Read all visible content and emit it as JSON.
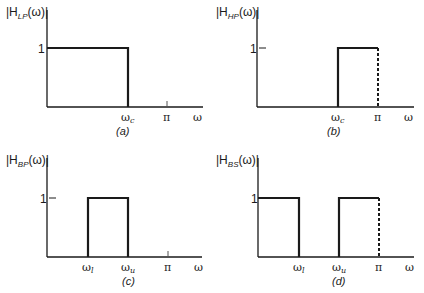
{
  "panels": [
    {
      "id": "a",
      "caption": "(a)",
      "ylabel_main": "|H",
      "ylabel_sub": "LP",
      "ylabel_tail": "(ω)|",
      "ytick": "1",
      "xticks": [
        {
          "main": "ω",
          "sub": "c"
        },
        {
          "main": "π",
          "sub": ""
        },
        {
          "main": "ω",
          "sub": ""
        }
      ],
      "type": "lowpass"
    },
    {
      "id": "b",
      "caption": "(b)",
      "ylabel_main": "|H",
      "ylabel_sub": "HP",
      "ylabel_tail": "(ω)|",
      "ytick": "1",
      "xticks": [
        {
          "main": "ω",
          "sub": "c"
        },
        {
          "main": "π",
          "sub": ""
        },
        {
          "main": "ω",
          "sub": ""
        }
      ],
      "type": "highpass"
    },
    {
      "id": "c",
      "caption": "(c)",
      "ylabel_main": "|H",
      "ylabel_sub": "BP",
      "ylabel_tail": "(ω)|",
      "ytick": "1",
      "xticks": [
        {
          "main": "ω",
          "sub": "l"
        },
        {
          "main": "ω",
          "sub": "u"
        },
        {
          "main": "π",
          "sub": ""
        },
        {
          "main": "ω",
          "sub": ""
        }
      ],
      "type": "bandpass"
    },
    {
      "id": "d",
      "caption": "(d)",
      "ylabel_main": "|H",
      "ylabel_sub": "BS",
      "ylabel_tail": "(ω)|",
      "ytick": "1",
      "xticks": [
        {
          "main": "ω",
          "sub": "l"
        },
        {
          "main": "ω",
          "sub": "u"
        },
        {
          "main": "π",
          "sub": ""
        },
        {
          "main": "ω",
          "sub": ""
        }
      ],
      "type": "bandstop"
    }
  ],
  "colors": {
    "line": "#1a1a1a",
    "background": "#ffffff"
  }
}
